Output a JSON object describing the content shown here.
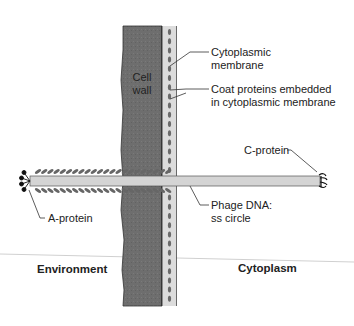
{
  "diagram": {
    "labels": {
      "cell_wall": [
        "Cell",
        "wall"
      ],
      "cytoplasmic_membrane": [
        "Cytoplasmic",
        "membrane"
      ],
      "coat_proteins": [
        "Coat proteins embedded",
        "in cytoplasmic membrane"
      ],
      "c_protein": "C-protein",
      "a_protein": "A-protein",
      "phage_dna": [
        "Phage DNA:",
        "ss circle"
      ],
      "environment": "Environment",
      "cytoplasm": "Cytoplasm"
    },
    "colors": {
      "cell_wall": "#6e6e6e",
      "membrane": "#d9d9d9",
      "coat_protein": "#6a6a6a",
      "phage_dna": "#d2d2d2",
      "leader_line": "#333333",
      "divider": "#cfcfcf"
    }
  }
}
